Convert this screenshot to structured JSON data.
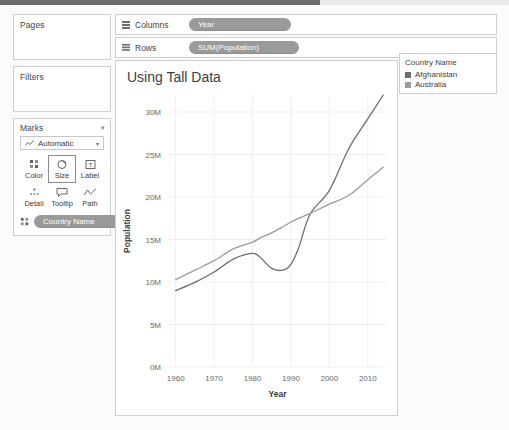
{
  "left_panel": {
    "pages": {
      "title": "Pages"
    },
    "filters": {
      "title": "Filters"
    },
    "marks": {
      "title": "Marks",
      "mark_type": "Automatic",
      "buttons": [
        {
          "label": "Color",
          "icon": "color-dots-icon",
          "selected": false
        },
        {
          "label": "Size",
          "icon": "size-circle-icon",
          "selected": true
        },
        {
          "label": "Label",
          "icon": "label-text-icon",
          "selected": false
        },
        {
          "label": "Detail",
          "icon": "detail-dots-icon",
          "selected": false
        },
        {
          "label": "Tooltip",
          "icon": "tooltip-bubble-icon",
          "selected": false
        },
        {
          "label": "Path",
          "icon": "path-line-icon",
          "selected": false
        }
      ],
      "encoding_pill": "Country Name"
    }
  },
  "shelves": {
    "columns": {
      "label": "Columns",
      "pill": "Year",
      "icon": "columns-grid-icon"
    },
    "rows": {
      "label": "Rows",
      "pill": "SUM(Population)",
      "icon": "rows-grid-icon"
    }
  },
  "legend": {
    "title": "Country Name",
    "items": [
      {
        "label": "Afghanistan",
        "color": "#6e6e6e"
      },
      {
        "label": "Australia",
        "color": "#9b9b9b"
      }
    ]
  },
  "colors": {
    "pill": "#9a9a9a",
    "panel_border": "#cfcfcf",
    "grid": "#efefef",
    "axis_text": "#6a6a6a"
  },
  "chart_data": {
    "type": "line",
    "title": "Using Tall Data",
    "xlabel": "Year",
    "ylabel": "Population",
    "xlim": [
      1958,
      2015
    ],
    "ylim": [
      0,
      32000000
    ],
    "xticks": [
      1960,
      1970,
      1980,
      1990,
      2000,
      2010
    ],
    "xtick_labels": [
      "1960",
      "1970",
      "1980",
      "1990",
      "2000",
      "2010"
    ],
    "yticks": [
      0,
      5000000,
      10000000,
      15000000,
      20000000,
      25000000,
      30000000
    ],
    "ytick_labels": [
      "0M",
      "5M",
      "10M",
      "15M",
      "20M",
      "25M",
      "30M"
    ],
    "grid": true,
    "legend_position": "right-outside",
    "x": [
      1960,
      1965,
      1970,
      1975,
      1980,
      1982,
      1985,
      1988,
      1990,
      1992,
      1995,
      2000,
      2005,
      2010,
      2014
    ],
    "series": [
      {
        "name": "Afghanistan",
        "color": "#6e6e6e",
        "values": [
          8997000,
          9957000,
          11173000,
          12689000,
          13356000,
          12900000,
          11600000,
          11400000,
          12067000,
          14000000,
          18000000,
          20780000,
          25654000,
          29185000,
          32000000
        ]
      },
      {
        "name": "Australia",
        "color": "#9b9b9b",
        "values": [
          10276000,
          11388000,
          12507000,
          13893000,
          14692000,
          15184000,
          15788000,
          16532000,
          17065000,
          17495000,
          18072000,
          19153000,
          20177000,
          22032000,
          23500000
        ]
      }
    ]
  }
}
